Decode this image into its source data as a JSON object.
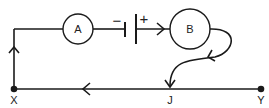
{
  "diagram": {
    "type": "circuit",
    "components": [
      {
        "id": "A",
        "label": "A",
        "kind": "circle"
      },
      {
        "id": "battery",
        "kind": "cell",
        "negative_label": "−",
        "positive_label": "+"
      },
      {
        "id": "B",
        "label": "B",
        "kind": "circle"
      }
    ],
    "nodes": [
      {
        "id": "X",
        "label": "X"
      },
      {
        "id": "J",
        "label": "J"
      },
      {
        "id": "Y",
        "label": "Y"
      }
    ],
    "arrows": [
      {
        "location": "battery-to-B",
        "direction": "right"
      },
      {
        "location": "left-wire",
        "direction": "up"
      },
      {
        "location": "bottom-wire",
        "direction": "left"
      },
      {
        "location": "curve-from-B",
        "direction": "down-left"
      },
      {
        "location": "into-J",
        "direction": "down"
      }
    ],
    "colors": {
      "line": "#1a1a1a",
      "background": "#ffffff"
    }
  }
}
